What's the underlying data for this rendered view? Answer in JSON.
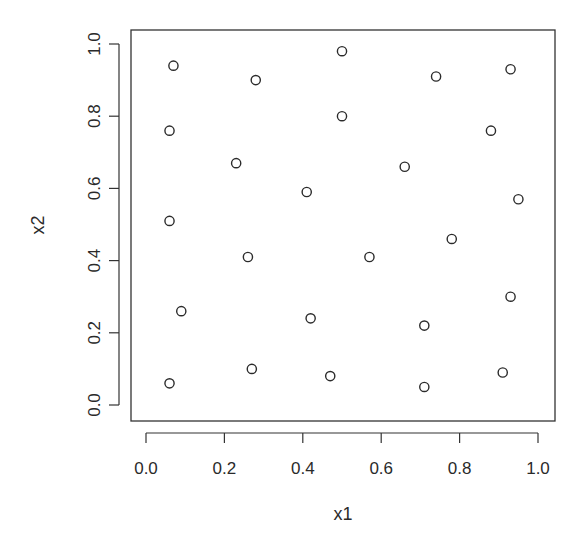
{
  "chart_data": {
    "type": "scatter",
    "title": "",
    "xlabel": "x1",
    "ylabel": "x2",
    "xlim": [
      0.0,
      1.0
    ],
    "ylim": [
      0.0,
      1.0
    ],
    "grid": false,
    "legend": null,
    "marker": "open-circle",
    "x_ticks": [
      "0.0",
      "0.2",
      "0.4",
      "0.6",
      "0.8",
      "1.0"
    ],
    "y_ticks": [
      "0.0",
      "0.2",
      "0.4",
      "0.6",
      "0.8",
      "1.0"
    ],
    "series": [
      {
        "name": "points",
        "points": [
          {
            "x": 0.07,
            "y": 0.94
          },
          {
            "x": 0.28,
            "y": 0.9
          },
          {
            "x": 0.5,
            "y": 0.98
          },
          {
            "x": 0.74,
            "y": 0.91
          },
          {
            "x": 0.93,
            "y": 0.93
          },
          {
            "x": 0.06,
            "y": 0.76
          },
          {
            "x": 0.5,
            "y": 0.8
          },
          {
            "x": 0.88,
            "y": 0.76
          },
          {
            "x": 0.23,
            "y": 0.67
          },
          {
            "x": 0.66,
            "y": 0.66
          },
          {
            "x": 0.41,
            "y": 0.59
          },
          {
            "x": 0.95,
            "y": 0.57
          },
          {
            "x": 0.06,
            "y": 0.51
          },
          {
            "x": 0.78,
            "y": 0.46
          },
          {
            "x": 0.26,
            "y": 0.41
          },
          {
            "x": 0.57,
            "y": 0.41
          },
          {
            "x": 0.93,
            "y": 0.3
          },
          {
            "x": 0.09,
            "y": 0.26
          },
          {
            "x": 0.42,
            "y": 0.24
          },
          {
            "x": 0.71,
            "y": 0.22
          },
          {
            "x": 0.27,
            "y": 0.1
          },
          {
            "x": 0.91,
            "y": 0.09
          },
          {
            "x": 0.47,
            "y": 0.08
          },
          {
            "x": 0.06,
            "y": 0.06
          },
          {
            "x": 0.71,
            "y": 0.05
          }
        ]
      }
    ]
  },
  "style": {
    "axis_color": "#333333",
    "marker_color": "#2b2b2b",
    "background": "#ffffff"
  }
}
